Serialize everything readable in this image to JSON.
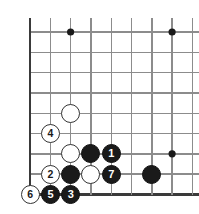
{
  "figure": {
    "kind": "go-board-diagram",
    "width": 199,
    "height": 214
  },
  "board": {
    "grid": {
      "origin_x": 30,
      "origin_y": 32,
      "spacing": 20.3,
      "cols": 9,
      "rows": 9,
      "line_color": "#8c8c8c",
      "line_width": 1.4,
      "edge_color": "#3a3a3a",
      "edge_width": 2.6,
      "edges": [
        "left",
        "bottom"
      ]
    },
    "star_points": [
      {
        "name": "star-point-upper-left",
        "col": 2,
        "row": 0
      },
      {
        "name": "star-point-upper-right",
        "col": 7,
        "row": 0
      },
      {
        "name": "star-point-right",
        "col": 7,
        "row": 6
      }
    ],
    "stone_diameter": 19,
    "colors": {
      "black": "#1a1a1a",
      "white": "#ffffff",
      "black_label": "#ffffff",
      "white_label": "#1a1a1a",
      "outline": "#333333"
    }
  },
  "stones": [
    {
      "name": "stone-white-unnumbered-upper",
      "color": "white",
      "label": "",
      "col": 2,
      "row": 4
    },
    {
      "name": "stone-white-move-4",
      "color": "white",
      "label": "4",
      "col": 1,
      "row": 5
    },
    {
      "name": "stone-white-unnumbered-lower",
      "color": "white",
      "label": "",
      "col": 2,
      "row": 6
    },
    {
      "name": "stone-black-unnumbered-upper",
      "color": "black",
      "label": "",
      "col": 3,
      "row": 6
    },
    {
      "name": "stone-black-move-1",
      "color": "black",
      "label": "1",
      "col": 4,
      "row": 6
    },
    {
      "name": "stone-white-move-2",
      "color": "white",
      "label": "2",
      "col": 1,
      "row": 7
    },
    {
      "name": "stone-black-unnumbered-lower",
      "color": "black",
      "label": "",
      "col": 2,
      "row": 7
    },
    {
      "name": "stone-white-unnumbered-center",
      "color": "white",
      "label": "",
      "col": 3,
      "row": 7
    },
    {
      "name": "stone-black-move-7",
      "color": "black",
      "label": "7",
      "col": 4,
      "row": 7
    },
    {
      "name": "stone-black-unnumbered-right",
      "color": "black",
      "label": "",
      "col": 6,
      "row": 7
    },
    {
      "name": "stone-white-move-6",
      "color": "white",
      "label": "6",
      "col": 0,
      "row": 8
    },
    {
      "name": "stone-black-move-5",
      "color": "black",
      "label": "5",
      "col": 1,
      "row": 8
    },
    {
      "name": "stone-black-move-3",
      "color": "black",
      "label": "3",
      "col": 2,
      "row": 8
    }
  ]
}
